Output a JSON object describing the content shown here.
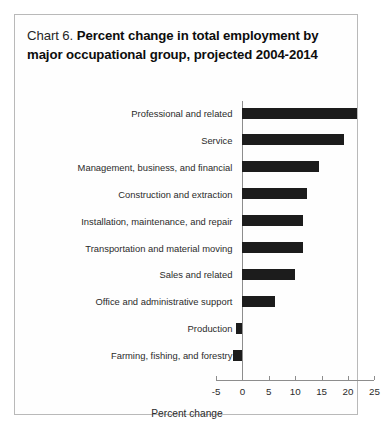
{
  "figure": {
    "title_lead": "Chart 6.",
    "title_bold": "Percent change in total employment by major occupational group, projected 2004-2014",
    "border_color": "#b9b9b9",
    "bar_color": "#1c1c1c",
    "axis_color": "#8d8d8d"
  },
  "chart_data": {
    "type": "bar",
    "orientation": "horizontal",
    "title": "Chart 6.  Percent change in total employment by major occupational group, projected 2004-2014",
    "xlabel": "Percent change",
    "ylabel": "",
    "xlim": [
      -5,
      25
    ],
    "xticks": [
      -5,
      0,
      5,
      10,
      15,
      20,
      25
    ],
    "xticklabels": [
      "-5",
      "0",
      "5",
      "10",
      "15",
      "20",
      "25"
    ],
    "grid": false,
    "legend": false,
    "categories": [
      "Professional and related",
      "Service",
      "Management, business, and financial",
      "Construction and extraction",
      "Installation, maintenance, and repair",
      "Transportation and material moving",
      "Sales and related",
      "Office and administrative support",
      "Production",
      "Farming, fishing, and forestry"
    ],
    "values": [
      21.8,
      19.3,
      14.6,
      12.3,
      11.5,
      11.4,
      10.0,
      6.1,
      -1.3,
      -1.8
    ]
  }
}
